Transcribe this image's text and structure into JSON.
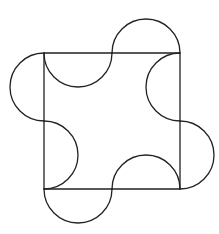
{
  "diagram": {
    "type": "geometry",
    "stroke_color": "#222222",
    "background": "#ffffff",
    "square": {
      "x": 44,
      "y": 53,
      "size": 136
    },
    "semicircle_radius": 34,
    "arcs": [
      {
        "side": "top",
        "from": [
          44,
          53
        ],
        "to": [
          112,
          53
        ],
        "direction": "inward"
      },
      {
        "side": "top",
        "from": [
          112,
          53
        ],
        "to": [
          180,
          53
        ],
        "direction": "outward"
      },
      {
        "side": "right",
        "from": [
          180,
          53
        ],
        "to": [
          180,
          121
        ],
        "direction": "inward"
      },
      {
        "side": "right",
        "from": [
          180,
          121
        ],
        "to": [
          180,
          189
        ],
        "direction": "outward"
      },
      {
        "side": "bottom",
        "from": [
          180,
          189
        ],
        "to": [
          112,
          189
        ],
        "direction": "inward"
      },
      {
        "side": "bottom",
        "from": [
          112,
          189
        ],
        "to": [
          44,
          189
        ],
        "direction": "outward"
      },
      {
        "side": "left",
        "from": [
          44,
          189
        ],
        "to": [
          44,
          121
        ],
        "direction": "inward"
      },
      {
        "side": "left",
        "from": [
          44,
          121
        ],
        "to": [
          44,
          53
        ],
        "direction": "outward"
      }
    ]
  }
}
